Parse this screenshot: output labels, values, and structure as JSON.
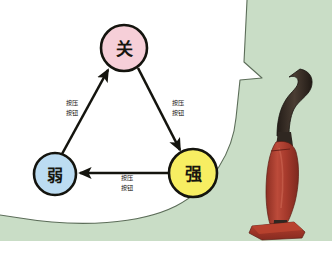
{
  "scene": {
    "width": 332,
    "height": 255,
    "background_color": "#ffffff",
    "wall_color": "#c9ddc6",
    "bubble_color": "#ffffff",
    "bubble_outline_color": "#5b6b58"
  },
  "diagram": {
    "type": "state-transition-cycle",
    "nodes": [
      {
        "id": "off",
        "label": "关",
        "fill": "#f6cfd8",
        "stroke": "#14140e",
        "cx": 124,
        "cy": 48,
        "r": 23,
        "font_size": 17
      },
      {
        "id": "weak",
        "label": "弱",
        "fill": "#bcdcf2",
        "stroke": "#14140e",
        "cx": 55,
        "cy": 174,
        "r": 21,
        "font_size": 16
      },
      {
        "id": "strong",
        "label": "强",
        "fill": "#f7ee62",
        "stroke": "#14140e",
        "cx": 193,
        "cy": 173,
        "r": 24,
        "font_size": 17
      }
    ],
    "edges": [
      {
        "id": "weak-to-off",
        "from": "weak",
        "to": "off",
        "label_line1": "按压",
        "label_line2": "按钮",
        "label_x": 72,
        "label_y": 105
      },
      {
        "id": "off-to-strong",
        "from": "off",
        "to": "strong",
        "label_line1": "按压",
        "label_line2": "按钮",
        "label_x": 178,
        "label_y": 105
      },
      {
        "id": "strong-to-weak",
        "from": "strong",
        "to": "weak",
        "label_line1": "按压",
        "label_line2": "按钮",
        "label_x": 127,
        "label_y": 180
      }
    ]
  },
  "illustration": {
    "name": "upright-vacuum-cleaner",
    "handle_color": "#3b3129",
    "body_color": "#b04032",
    "body_shadow_color": "#8d2e22",
    "base_color": "#a8392c"
  }
}
